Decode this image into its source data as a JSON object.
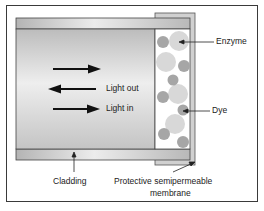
{
  "diagram": {
    "type": "optical fiber enzyme biosensor cross-section",
    "labels": {
      "light_out": "Light out",
      "light_in": "Light in",
      "enzyme": "Enzyme",
      "dye": "Dye",
      "cladding": "Cladding",
      "membrane_line1": "Protective semipermeable",
      "membrane_line2": "membrane"
    },
    "arrows": [
      {
        "direction": "right",
        "label": ""
      },
      {
        "direction": "left",
        "label": "Light out"
      },
      {
        "direction": "right",
        "label": "Light in"
      }
    ],
    "colors": {
      "frame": "#3a3a3a",
      "cladding": "#bdbdbd",
      "core": "#cfcfcf",
      "membrane": "#c8c8c8",
      "enzyme": "#d4d4d4",
      "dye": "#a8a8a8",
      "arrow": "#111111"
    }
  }
}
